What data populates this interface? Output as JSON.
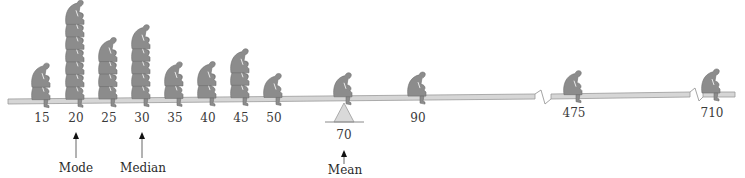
{
  "figure": {
    "colors": {
      "figure_fill": "#8c8c8c",
      "figure_stroke": "#6e6e6e",
      "beam_fill": "#d6d6d6",
      "beam_stroke": "#9a9a9a",
      "fulcrum_fill": "#d9d9d9",
      "text": "#333333"
    }
  },
  "chart_data": {
    "type": "pictograph",
    "title": "",
    "xlabel": "",
    "ylabel": "",
    "categories": [
      "15",
      "20",
      "25",
      "30",
      "35",
      "40",
      "45",
      "50",
      "70",
      "90",
      "475",
      "710"
    ],
    "values": [
      2,
      7,
      4,
      5,
      2,
      2,
      3,
      1,
      1,
      1,
      1,
      1
    ],
    "axis_breaks": [
      "between 90 and 475",
      "between 475 and 710"
    ],
    "total_count": 30,
    "annotations": [
      {
        "label": "Mode",
        "value": 20
      },
      {
        "label": "Median",
        "value": 30
      },
      {
        "label": "Mean",
        "value": 70,
        "marker": "fulcrum"
      }
    ]
  },
  "ticks": [
    {
      "label": "15",
      "x": 42,
      "count": 2
    },
    {
      "label": "20",
      "x": 76,
      "count": 7
    },
    {
      "label": "25",
      "x": 109,
      "count": 4
    },
    {
      "label": "30",
      "x": 142,
      "count": 5
    },
    {
      "label": "35",
      "x": 175,
      "count": 2
    },
    {
      "label": "40",
      "x": 208,
      "count": 2
    },
    {
      "label": "45",
      "x": 241,
      "count": 3
    },
    {
      "label": "50",
      "x": 274,
      "count": 1
    },
    {
      "label": "70",
      "x": 344,
      "count": 1
    },
    {
      "label": "90",
      "x": 418,
      "count": 1
    },
    {
      "label": "475",
      "x": 574,
      "count": 1
    },
    {
      "label": "710",
      "x": 712,
      "count": 1
    }
  ],
  "labels": {
    "mode": "Mode",
    "median": "Median",
    "mean": "Mean"
  }
}
